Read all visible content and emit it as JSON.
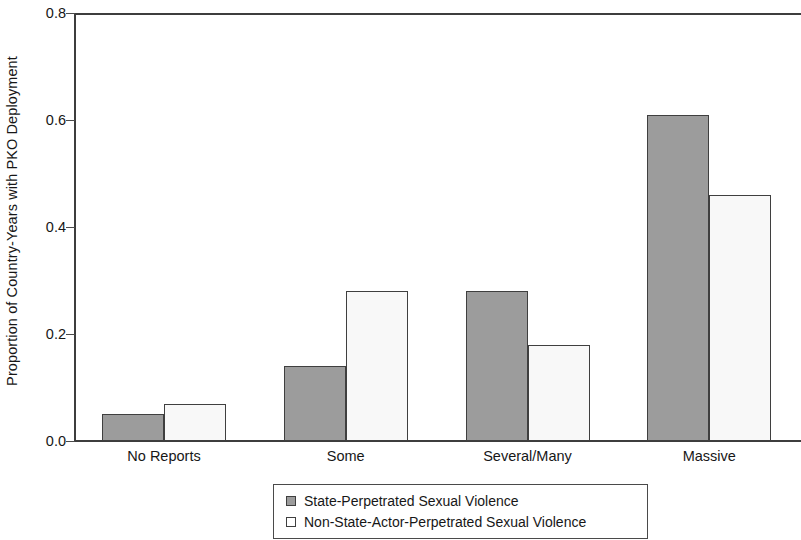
{
  "chart_data": {
    "type": "bar",
    "title": "",
    "xlabel": "",
    "ylabel": "Proportion of Country-Years with PKO Deployment",
    "categories": [
      "No Reports",
      "Some",
      "Several/Many",
      "Massive"
    ],
    "series": [
      {
        "name": "State-Perpetrated Sexual Violence",
        "color": "#9c9c9c",
        "values": [
          0.05,
          0.14,
          0.28,
          0.61
        ]
      },
      {
        "name": "Non-State-Actor-Perpetrated Sexual Violence",
        "color": "#f8f8f8",
        "values": [
          0.07,
          0.28,
          0.18,
          0.46
        ]
      }
    ],
    "ylim": [
      0.0,
      0.8
    ],
    "ytick_values": [
      0.0,
      0.2,
      0.4,
      0.6,
      0.8
    ],
    "ytick_labels": [
      "0.0",
      "0.2",
      "0.4",
      "0.6",
      "0.8"
    ],
    "grid": false,
    "legend_position": "bottom-center",
    "legend": [
      "State-Perpetrated Sexual Violence",
      "Non-State-Actor-Perpetrated Sexual Violence"
    ]
  }
}
